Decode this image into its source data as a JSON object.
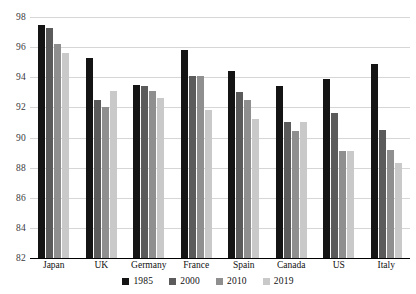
{
  "chart_data": {
    "type": "bar",
    "title": "",
    "subtitle": "",
    "xlabel": "",
    "ylabel": "",
    "ylim": [
      82,
      98
    ],
    "ytick_step": 2,
    "yticks": [
      82,
      84,
      86,
      88,
      90,
      92,
      94,
      96,
      98
    ],
    "grid": true,
    "legend_position": "bottom",
    "categories": [
      "Japan",
      "UK",
      "Germany",
      "France",
      "Spain",
      "Canada",
      "US",
      "Italy"
    ],
    "series": [
      {
        "name": "1985",
        "color": "#141414",
        "values": [
          97.5,
          95.3,
          93.5,
          95.8,
          94.4,
          93.4,
          93.9,
          94.9
        ]
      },
      {
        "name": "2000",
        "color": "#5b5b5b",
        "values": [
          97.3,
          92.5,
          93.4,
          94.1,
          93.0,
          91.0,
          91.6,
          90.5
        ]
      },
      {
        "name": "2010",
        "color": "#8f8f8f",
        "values": [
          96.2,
          92.0,
          93.1,
          94.1,
          92.5,
          90.4,
          89.1,
          89.2
        ]
      },
      {
        "name": "2019",
        "color": "#c9c9c9",
        "values": [
          95.6,
          93.1,
          92.6,
          91.8,
          91.2,
          91.0,
          89.1,
          88.3
        ]
      }
    ]
  },
  "axis": {
    "tick_labels": [
      "98",
      "96",
      "94",
      "92",
      "90",
      "88",
      "86",
      "84",
      "82"
    ]
  },
  "legend": {
    "items": [
      {
        "label": "1985",
        "color": "#141414"
      },
      {
        "label": "2000",
        "color": "#5b5b5b"
      },
      {
        "label": "2010",
        "color": "#8f8f8f"
      },
      {
        "label": "2019",
        "color": "#c9c9c9"
      }
    ]
  },
  "colors": {
    "background": "#ffffff",
    "gridline": "#d6d6d6",
    "axis": "#000000",
    "tick_text": "#3a3a3a",
    "label_text": "#101010"
  }
}
